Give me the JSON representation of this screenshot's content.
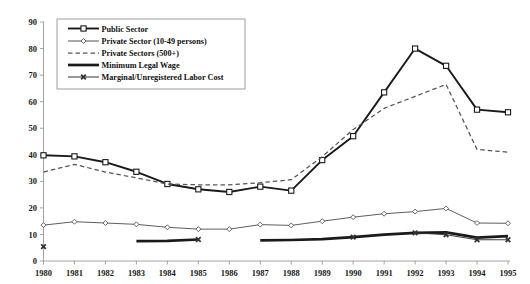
{
  "chart_data": {
    "type": "line",
    "title": "",
    "subtitle": "",
    "xlabel": "",
    "ylabel": "",
    "x": [
      1980,
      1981,
      1982,
      1983,
      1984,
      1985,
      1986,
      1987,
      1988,
      1989,
      1990,
      1991,
      1992,
      1993,
      1994,
      1995
    ],
    "xtick_labels": [
      "1980",
      "1981",
      "1982",
      "1983",
      "1984",
      "1985",
      "1986",
      "1987",
      "1988",
      "1989",
      "1990",
      "1991",
      "1992",
      "1993",
      "1994",
      "1995"
    ],
    "ytick_labels": [
      "0",
      "10",
      "20",
      "30",
      "40",
      "50",
      "60",
      "70",
      "80",
      "90"
    ],
    "yticks": [
      0,
      10,
      20,
      30,
      40,
      50,
      60,
      70,
      80,
      90
    ],
    "ylim": [
      0,
      90
    ],
    "xlim": [
      1980,
      1995
    ],
    "grid": false,
    "legend_position": "top-left",
    "series": [
      {
        "name": "Public Sector",
        "marker": "square-open",
        "style": "solid-thick",
        "color": "#1a1a1a",
        "values": [
          39.8,
          39.4,
          37.2,
          33.6,
          29.0,
          27.0,
          26.0,
          28.0,
          26.5,
          38.0,
          47.0,
          63.5,
          80.0,
          73.5,
          57.0,
          56.0
        ]
      },
      {
        "name": "Private Sector (10-49 persons)",
        "marker": "diamond-open",
        "style": "solid-thin",
        "color": "#555555",
        "values": [
          13.5,
          14.8,
          14.3,
          13.8,
          12.7,
          12.0,
          12.0,
          13.7,
          13.4,
          15.0,
          16.5,
          17.8,
          18.6,
          19.8,
          14.3,
          14.2
        ]
      },
      {
        "name": "Private Sectors (500+)",
        "marker": "none",
        "style": "dashed",
        "color": "#555555",
        "values": [
          33.5,
          36.4,
          33.5,
          31.3,
          29.0,
          28.7,
          28.7,
          29.5,
          30.6,
          39.3,
          49.5,
          57.5,
          62.0,
          66.5,
          42.0,
          41.0
        ]
      },
      {
        "name": "Minimum Legal Wage",
        "marker": "none",
        "style": "solid-very-thick",
        "color": "#1a1a1a",
        "segments": [
          {
            "x": [
              1983,
              1984,
              1985
            ],
            "values": [
              7.5,
              7.6,
              8.1
            ]
          },
          {
            "x": [
              1987,
              1988,
              1989,
              1990,
              1991,
              1992,
              1993,
              1994,
              1995
            ],
            "values": [
              7.8,
              7.9,
              8.2,
              9.0,
              9.9,
              10.6,
              10.8,
              8.8,
              9.4
            ]
          }
        ]
      },
      {
        "name": "Marginal/Unregistered Labor Cost",
        "marker": "x",
        "style": "solid-thin-marker",
        "color": "#333333",
        "points": [
          {
            "x": 1980,
            "value": 5.4
          },
          {
            "x": 1985,
            "value": 8.1
          },
          {
            "x": 1990,
            "value": 9.0
          },
          {
            "x": 1992,
            "value": 10.6
          },
          {
            "x": 1993,
            "value": 9.9
          },
          {
            "x": 1994,
            "value": 8.0
          },
          {
            "x": 1995,
            "value": 8.0
          }
        ]
      }
    ]
  },
  "legend": {
    "items": [
      {
        "label": "Public Sector",
        "key": "public-sector"
      },
      {
        "label": "Private Sector (10-49 persons)",
        "key": "private-sector-10-49"
      },
      {
        "label": "Private Sectors (500+)",
        "key": "private-sectors-500"
      },
      {
        "label": "Minimum Legal Wage",
        "key": "minimum-legal-wage"
      },
      {
        "label": "Marginal/Unregistered Labor Cost",
        "key": "marginal-unregistered-labor-cost"
      }
    ]
  },
  "axis": {
    "y_labels": [
      "90",
      "80",
      "70",
      "60",
      "50",
      "40",
      "30",
      "20",
      "10",
      "0"
    ],
    "x_labels": [
      "1980",
      "1981",
      "1982",
      "1983",
      "1984",
      "1985",
      "1986",
      "1987",
      "1988",
      "1989",
      "1990",
      "1991",
      "1992",
      "1993",
      "1994",
      "1995"
    ]
  }
}
